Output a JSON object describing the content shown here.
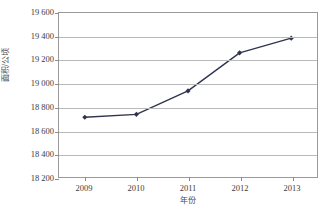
{
  "chart_data": {
    "type": "line",
    "title": "",
    "subtitle": "",
    "xlabel": "年份",
    "ylabel": "面积/公顷",
    "categories": [
      "2009",
      "2010",
      "2011",
      "2012",
      "2013"
    ],
    "x": [
      2009,
      2010,
      2011,
      2012,
      2013
    ],
    "values": [
      18710,
      18735,
      18935,
      19260,
      19385
    ],
    "series": [
      {
        "name": "面积",
        "values": [
          18710,
          18735,
          18935,
          19260,
          19385
        ]
      }
    ],
    "ylim": [
      18200,
      19600
    ],
    "yticks": [
      18200,
      18400,
      18600,
      18800,
      19000,
      19200,
      19400,
      19600
    ],
    "ytick_labels": [
      "18 200",
      "18 400",
      "18 600",
      "18 800",
      "19 000",
      "19 200",
      "19 400",
      "19 600"
    ],
    "xtick_labels": [
      "2009",
      "2010",
      "2011",
      "2012",
      "2013"
    ],
    "grid": true,
    "grid_axis": "y",
    "legend": false,
    "legend_position": "none",
    "marker": "diamond",
    "annotations": []
  },
  "style": {
    "series_color": "#2f3550",
    "grid_color": "#b9b9b9",
    "frame_color": "#9a9a9a",
    "text_color": "#3c3c3c",
    "background": "#ffffff"
  }
}
